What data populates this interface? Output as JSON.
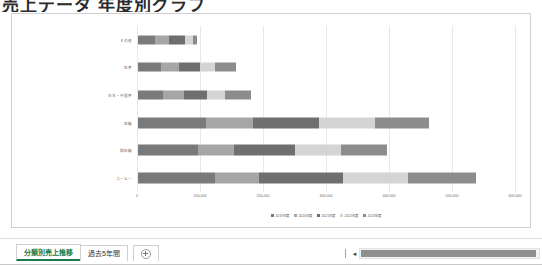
{
  "window": {
    "title_partial": "売上データ 年度別グラフ"
  },
  "chart_data": {
    "type": "bar",
    "orientation": "horizontal",
    "stacked": true,
    "title": "",
    "xlabel": "",
    "ylabel": "",
    "categories": [
      "その他",
      "紅茶",
      "日本・中国茶",
      "豆類",
      "飲料類",
      "コーヒー"
    ],
    "legend": [
      "2019年度",
      "2020年度",
      "2021年度",
      "2022年度",
      "2023年度"
    ],
    "legend_position": "bottom",
    "series": [
      {
        "name": "2019年度",
        "values": [
          27000,
          36000,
          40000,
          108000,
          96000,
          122000
        ]
      },
      {
        "name": "2020年度",
        "values": [
          22000,
          29000,
          33000,
          75000,
          56000,
          70000
        ]
      },
      {
        "name": "2021年度",
        "values": [
          25000,
          33000,
          37000,
          105000,
          97000,
          134000
        ]
      },
      {
        "name": "2022年度",
        "values": [
          14000,
          25000,
          28000,
          88000,
          73000,
          102000
        ]
      },
      {
        "name": "2023年度",
        "values": [
          6000,
          32000,
          42000,
          86000,
          74000,
          108000
        ]
      }
    ],
    "xticks": [
      "0",
      "100,000",
      "200,000",
      "300,000",
      "400,000",
      "500,000",
      "600,000"
    ],
    "xlim": [
      0,
      600000
    ],
    "grid": true,
    "colors": [
      "#7a7a7a",
      "#a6a6a6",
      "#6f6f6f",
      "#d4d4d4",
      "#8c8c8c"
    ]
  },
  "sheet_tabs": {
    "items": [
      {
        "label": "分類別売上推移",
        "active": true
      },
      {
        "label": "過去5年間",
        "active": false
      }
    ],
    "add_sheet_label": "新しいシート"
  },
  "scrollbar": {
    "left_arrow": "◄"
  }
}
